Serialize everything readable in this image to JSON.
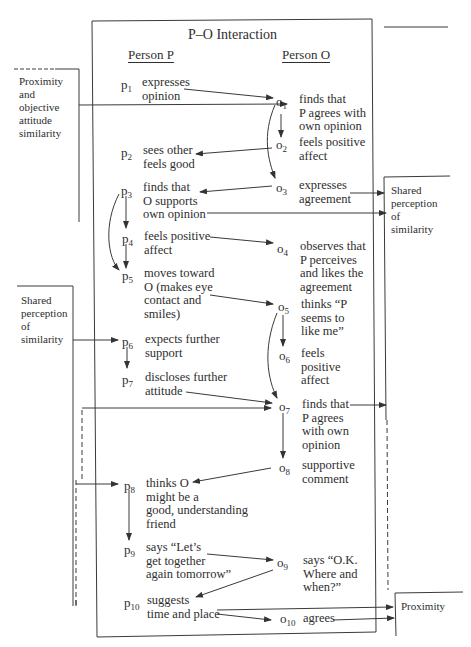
{
  "title": "P–O Interaction",
  "columns": {
    "person_p": "Person P",
    "person_o": "Person O"
  },
  "p_steps": [
    {
      "id": "p",
      "n": "1",
      "text": "expresses\nopinion"
    },
    {
      "id": "p",
      "n": "2",
      "text": "sees other\nfeels good"
    },
    {
      "id": "p",
      "n": "3",
      "text": "finds that\nO supports\nown opinion"
    },
    {
      "id": "p",
      "n": "4",
      "text": "feels positive\naffect"
    },
    {
      "id": "p",
      "n": "5",
      "text": "moves toward\nO (makes eye\ncontact and\nsmiles)"
    },
    {
      "id": "p",
      "n": "6",
      "text": "expects further\nsupport"
    },
    {
      "id": "p",
      "n": "7",
      "text": "discloses further\nattitude"
    },
    {
      "id": "p",
      "n": "8",
      "text": "thinks O\nmight be a\ngood, understanding\nfriend"
    },
    {
      "id": "p",
      "n": "9",
      "text": "says “Let’s\nget together\nagain tomorrow”"
    },
    {
      "id": "p",
      "n": "10",
      "text": "suggests\ntime and place"
    }
  ],
  "o_steps": [
    {
      "id": "o",
      "n": "1",
      "text": "finds that\nP agrees with\nown opinion"
    },
    {
      "id": "o",
      "n": "2",
      "text": "feels positive\naffect"
    },
    {
      "id": "o",
      "n": "3",
      "text": "expresses\nagreement"
    },
    {
      "id": "o",
      "n": "4",
      "text": "observes that\nP perceives\nand likes the\nagreement"
    },
    {
      "id": "o",
      "n": "5",
      "text": "thinks “P\nseems to\nlike me”"
    },
    {
      "id": "o",
      "n": "6",
      "text": "feels\npositive\naffect"
    },
    {
      "id": "o",
      "n": "7",
      "text": "finds that\nP agrees\nwith own\nopinion"
    },
    {
      "id": "o",
      "n": "8",
      "text": "supportive\ncomment"
    },
    {
      "id": "o",
      "n": "9",
      "text": "says “O.K.\nWhere and\nwhen?”"
    },
    {
      "id": "o",
      "n": "10",
      "text": "agrees"
    }
  ],
  "side_boxes": {
    "left_top": "Proximity\nand\nobjective\nattitude\nsimilarity",
    "left_mid": "Shared\nperception\nof\nsimilarity",
    "right_top": "Shared\nperception\nof\nsimilarity",
    "right_bottom": "Proximity"
  },
  "colors": {
    "line": "#3a3a3a",
    "text": "#2e2e2e",
    "background": "#ffffff"
  }
}
